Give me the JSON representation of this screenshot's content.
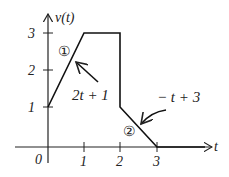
{
  "diagram": {
    "y_axis_label": "v(t)",
    "x_axis_label": "t",
    "origin_label": "0",
    "x_ticks": [
      "1",
      "2",
      "3"
    ],
    "y_ticks": [
      "1",
      "2",
      "3"
    ],
    "segment1_marker": "①",
    "segment2_marker": "②",
    "segment1_equation": "2t + 1",
    "segment2_equation": "− t + 3",
    "waveform_points": [
      [
        0,
        1
      ],
      [
        1,
        3
      ],
      [
        2,
        3
      ],
      [
        2,
        1
      ],
      [
        3,
        0
      ],
      [
        4.1,
        0
      ]
    ],
    "line_color": "#111111"
  }
}
